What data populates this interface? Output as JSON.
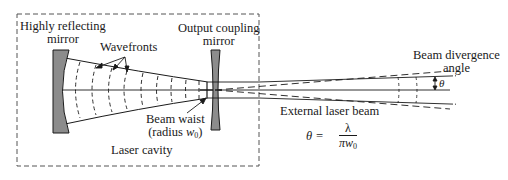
{
  "diagram": {
    "labels": {
      "highly_reflecting_mirror_line1": "Highly reflecting",
      "highly_reflecting_mirror_line2": "mirror",
      "wavefronts": "Wavefronts",
      "output_coupling_mirror_line1": "Output coupling",
      "output_coupling_mirror_line2": "mirror",
      "beam_waist_line1": "Beam waist",
      "beam_waist_line2_prefix": "(radius ",
      "beam_waist_symbol": "w",
      "beam_waist_subscript": "0",
      "beam_waist_line2_suffix": ")",
      "laser_cavity": "Laser cavity",
      "beam_divergence_line1": "Beam divergence",
      "beam_divergence_line2": "angle",
      "theta_symbol": "θ",
      "external_laser_beam": "External laser beam"
    },
    "equation": {
      "lhs": "θ =",
      "numerator": "λ",
      "denominator": "πw",
      "denominator_subscript": "0"
    },
    "colors": {
      "line": "#1a1a1a",
      "mirror_fill": "#8c8c8c",
      "background": "#ffffff"
    }
  }
}
